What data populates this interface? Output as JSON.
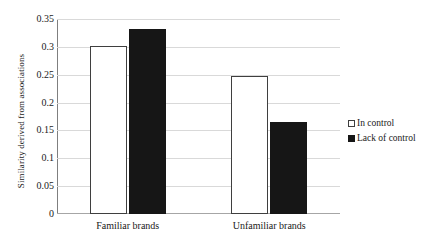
{
  "chart_data": {
    "type": "bar",
    "title": "",
    "xlabel": "",
    "ylabel": "Similarity derived from associations",
    "categories": [
      "Familiar brands",
      "Unfamiliar brands"
    ],
    "series": [
      {
        "name": "In control",
        "values": [
          0.301,
          0.248
        ],
        "color": "#ffffff"
      },
      {
        "name": "Lack of control",
        "values": [
          0.332,
          0.165
        ],
        "color": "#161616"
      }
    ],
    "ylim": [
      0,
      0.35
    ],
    "ytick_values": [
      0,
      0.05,
      0.1,
      0.15,
      0.2,
      0.25,
      0.3,
      0.35
    ],
    "ytick_labels": [
      "0",
      "0.05",
      "0.1",
      "0.15",
      "0.2",
      "0.25",
      "0.3",
      "0.35"
    ],
    "grid": true,
    "legend_position": "right"
  },
  "axes": {
    "y_title": "Similarity derived from associations"
  }
}
